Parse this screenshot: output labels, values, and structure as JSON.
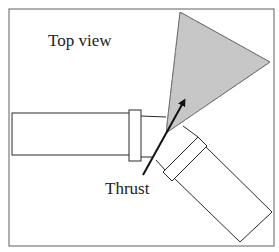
{
  "diagram": {
    "title_label": "Top view",
    "thrust_label": "Thrust",
    "colors": {
      "frame": "#7a7a7a",
      "stroke": "#2a2a2a",
      "spray_fill": "#c4c4c4",
      "arrow": "#111111"
    },
    "components": [
      "frame",
      "inlet-pipe",
      "inlet-flange",
      "outlet-pipe",
      "outlet-flange",
      "spray-cone",
      "thrust-arrow"
    ]
  }
}
